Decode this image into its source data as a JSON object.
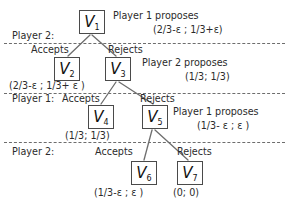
{
  "diagram": {
    "colors": {
      "background": "#ffffff",
      "node_border": "#4a4a4a",
      "edge": "#6d6d6d",
      "separator": "#6d6d6d",
      "text": "#2b2b2b"
    },
    "nodes": [
      {
        "id": "v1",
        "label": "V",
        "sub": "1"
      },
      {
        "id": "v2",
        "label": "V",
        "sub": "2"
      },
      {
        "id": "v3",
        "label": "V",
        "sub": "3"
      },
      {
        "id": "v4",
        "label": "V",
        "sub": "4"
      },
      {
        "id": "v5",
        "label": "V",
        "sub": "5"
      },
      {
        "id": "v6",
        "label": "V",
        "sub": "6"
      },
      {
        "id": "v7",
        "label": "V",
        "sub": "7"
      }
    ],
    "stage_labels": [
      {
        "id": "stage-player-2-top",
        "text": "Player 2:"
      },
      {
        "id": "stage-player-1-middle",
        "text": "Player 1:"
      },
      {
        "id": "stage-player-2-bottom",
        "text": "Player 2:"
      }
    ],
    "edge_labels": [
      {
        "id": "accepts-1",
        "text": "Accepts"
      },
      {
        "id": "rejects-1",
        "text": "Rejects"
      },
      {
        "id": "accepts-2",
        "text": "Accepts"
      },
      {
        "id": "rejects-2",
        "text": "Rejects"
      },
      {
        "id": "accepts-3",
        "text": "Accepts"
      },
      {
        "id": "rejects-3",
        "text": "Rejects"
      }
    ],
    "proposals": [
      {
        "id": "proposal-1",
        "who": "Player 1 proposes",
        "offer": "(2/3-ε ; 1/3+ε)"
      },
      {
        "id": "proposal-2",
        "who": "Player 2 proposes",
        "offer": "(1/3; 1/3)"
      },
      {
        "id": "proposal-3",
        "who": "Player 1 proposes",
        "offer": "(1/3- ε ; ε )"
      }
    ],
    "payoffs": [
      {
        "id": "payoff-v2",
        "text": "(2/3-ε ; 1/3+ ε )"
      },
      {
        "id": "payoff-v4",
        "text": "(1/3; 1/3)"
      },
      {
        "id": "payoff-v6",
        "text": "(1/3-ε ; ε )"
      },
      {
        "id": "payoff-v7",
        "text": "(0; 0)"
      }
    ]
  }
}
